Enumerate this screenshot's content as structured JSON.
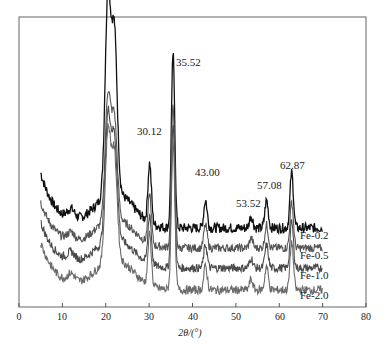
{
  "chart_data": {
    "type": "line",
    "title": "",
    "xlabel": "2θ/(°)",
    "ylabel": "",
    "xlim": [
      0,
      80
    ],
    "x_ticks": [
      0,
      10,
      20,
      30,
      40,
      50,
      60,
      70,
      80
    ],
    "y_ticks": [],
    "grid": false,
    "legend_position": "inline-right",
    "x_range_data": [
      5,
      70
    ],
    "series": [
      {
        "name": "Fe-0.2",
        "color": "#111111",
        "offset": 0
      },
      {
        "name": "Fe-0.5",
        "color": "#555555",
        "offset": 1
      },
      {
        "name": "Fe-1.0",
        "color": "#4a4a4a",
        "offset": 2
      },
      {
        "name": "Fe-2.0",
        "color": "#6a6a6a",
        "offset": 3
      }
    ],
    "peaks": [
      {
        "x": 20.5,
        "label": "",
        "rel_height": 1.0
      },
      {
        "x": 22.0,
        "label": "",
        "rel_height": 0.8
      },
      {
        "x": 30.12,
        "label": "30.12",
        "rel_height": 0.3
      },
      {
        "x": 35.52,
        "label": "35.52",
        "rel_height": 0.88
      },
      {
        "x": 43.0,
        "label": "43.00",
        "rel_height": 0.14
      },
      {
        "x": 53.52,
        "label": "53.52",
        "rel_height": 0.06
      },
      {
        "x": 57.08,
        "label": "57.08",
        "rel_height": 0.14
      },
      {
        "x": 62.87,
        "label": "62.87",
        "rel_height": 0.28
      }
    ],
    "annotations": [
      "30.12",
      "35.52",
      "43.00",
      "53.52",
      "57.08",
      "62.87"
    ]
  },
  "labels": {
    "xlabel": "2θ/(°)",
    "x_ticks": [
      "0",
      "10",
      "20",
      "30",
      "40",
      "50",
      "60",
      "70",
      "80"
    ],
    "series": [
      "Fe-0.2",
      "Fe-0.5",
      "Fe-1.0",
      "Fe-2.0"
    ],
    "peaks": [
      "30.12",
      "35.52",
      "43.00",
      "53.52",
      "57.08",
      "62.87"
    ]
  }
}
